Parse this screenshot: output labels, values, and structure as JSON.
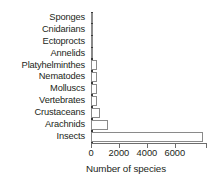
{
  "chart_data": {
    "type": "bar",
    "orientation": "horizontal",
    "title": "",
    "xlabel": "Number of species",
    "ylabel": "",
    "categories": [
      "Sponges",
      "Cnidarians",
      "Ectoprocts",
      "Annelids",
      "Platyhelminthes",
      "Nematodes",
      "Molluscs",
      "Vertebrates",
      "Crustaceans",
      "Arachnids",
      "Insects"
    ],
    "values": [
      10,
      10,
      20,
      110,
      400,
      400,
      400,
      400,
      650,
      1200,
      8000
    ],
    "xlim": [
      0,
      8300
    ],
    "xticks": [
      0,
      2000,
      4000,
      6000
    ],
    "xticklabels": [
      "0",
      "2000",
      "4000",
      "6000"
    ],
    "grid": false,
    "legend": null,
    "bar_fill": "#ffffff",
    "bar_edge": "#8a8a8a",
    "axis_color": "#6d6d6d",
    "text_color": "#231f20"
  }
}
